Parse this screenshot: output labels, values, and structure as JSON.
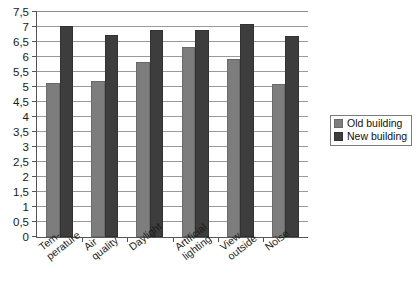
{
  "chart_data": {
    "type": "bar",
    "title": "",
    "xlabel": "",
    "ylabel": "",
    "ylim": [
      0,
      7.5
    ],
    "ytick_step": 0.5,
    "grid": true,
    "legend_position": "right",
    "decimal_separator": ",",
    "categories": [
      "Tem-\nperature",
      "Air\nquality",
      "Daylight",
      "Artificial\nlighting",
      "View\noutside",
      "Noise"
    ],
    "category_lines": [
      [
        "Tem-",
        "perature"
      ],
      [
        "Air",
        "quality"
      ],
      [
        "Daylight"
      ],
      [
        "Artificial",
        "lighting"
      ],
      [
        "View",
        "outside"
      ],
      [
        "Noise"
      ]
    ],
    "series": [
      {
        "name": "Old building",
        "color": "#7d7d7d",
        "values": [
          5.15,
          5.2,
          5.85,
          6.35,
          5.95,
          5.1
        ]
      },
      {
        "name": "New building",
        "color": "#3d3d3d",
        "values": [
          7.05,
          6.75,
          6.9,
          6.9,
          7.1,
          6.7
        ]
      }
    ],
    "ytick_labels": [
      "0",
      "0,5",
      "1",
      "1,5",
      "2",
      "2,5",
      "3",
      "3,5",
      "4",
      "4,5",
      "5",
      "5,5",
      "6",
      "6,5",
      "7",
      "7,5"
    ],
    "ytick_values": [
      0,
      0.5,
      1,
      1.5,
      2,
      2.5,
      3,
      3.5,
      4,
      4.5,
      5,
      5.5,
      6,
      6.5,
      7,
      7.5
    ]
  },
  "legend": {
    "items": [
      {
        "label": "Old building",
        "color": "#7d7d7d"
      },
      {
        "label": "New building",
        "color": "#3d3d3d"
      }
    ]
  }
}
